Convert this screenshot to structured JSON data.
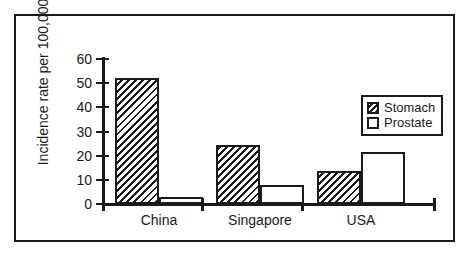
{
  "chart_data": {
    "type": "bar",
    "title": "",
    "xlabel": "",
    "ylabel": "Incidence rate per 100,000",
    "categories": [
      "China",
      "Singapore",
      "USA"
    ],
    "series": [
      {
        "name": "Stomach",
        "values": [
          52,
          24.5,
          13.5
        ],
        "fill": "hatched"
      },
      {
        "name": "Prostate",
        "values": [
          3,
          8,
          21.5
        ],
        "fill": "white"
      }
    ],
    "ylim": [
      0,
      60
    ],
    "yticks": [
      0,
      10,
      20,
      30,
      40,
      50,
      60
    ],
    "ytick_labels": [
      "0",
      "10",
      "20",
      "30",
      "40",
      "50",
      "60"
    ],
    "grid": false,
    "legend_position": "upper right",
    "legend_entries": [
      {
        "label": "Stomach",
        "swatch": "hatched-swatch"
      },
      {
        "label": "Prostate",
        "swatch": "empty-swatch"
      }
    ],
    "colors": {
      "ink": "#1a1a1a",
      "background": "#ffffff",
      "stomach_fill": "#1a1a1a",
      "prostate_fill": "#ffffff"
    }
  }
}
